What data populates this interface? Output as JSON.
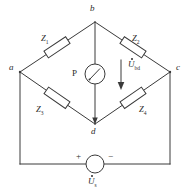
{
  "figure": {
    "line_color": "#3a3a3a",
    "text_color": "#2b2b2b",
    "background": "#ffffff"
  },
  "nodes": [
    {
      "id": "a",
      "label": "a",
      "x": 20,
      "y": 72
    },
    {
      "id": "b",
      "label": "b",
      "x": 95,
      "y": 22
    },
    {
      "id": "c",
      "label": "c",
      "x": 170,
      "y": 72
    },
    {
      "id": "d",
      "label": "d",
      "x": 95,
      "y": 124
    }
  ],
  "impedances": [
    {
      "id": "Z1",
      "label": "Z",
      "subscript": "1",
      "branch": "a-b"
    },
    {
      "id": "Z2",
      "label": "Z",
      "subscript": "2",
      "branch": "b-c"
    },
    {
      "id": "Z3",
      "label": "Z",
      "subscript": "3",
      "branch": "a-d"
    },
    {
      "id": "Z4",
      "label": "Z",
      "subscript": "4",
      "branch": "d-c"
    }
  ],
  "detector": {
    "name": "P",
    "label": "P",
    "type": "pointer-meter"
  },
  "bridge_voltage": {
    "label": "U",
    "subscript": "bd",
    "has_overdot": true,
    "direction": "down"
  },
  "source": {
    "label": "U",
    "subscript": "s",
    "has_overdot": true,
    "plus_label": "+",
    "minus_label": "−",
    "type": "ac-voltage-source"
  }
}
